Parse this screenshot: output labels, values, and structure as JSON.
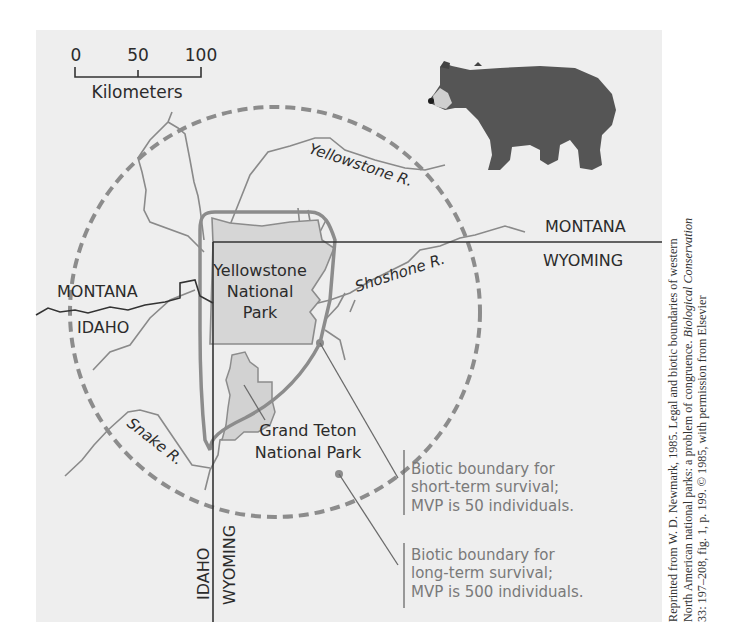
{
  "scale_bar": {
    "ticks": [
      "0",
      "50",
      "100"
    ],
    "unit_label": "Kilometers"
  },
  "state_labels": {
    "montana_east": "MONTANA",
    "wyoming_east": "WYOMING",
    "montana_west": "MONTANA",
    "idaho_west": "IDAHO",
    "idaho_south": "IDAHO",
    "wyoming_south": "WYOMING"
  },
  "rivers": {
    "yellowstone": "Yellowstone R.",
    "shoshone": "Shoshone R.",
    "snake": "Snake R."
  },
  "parks": {
    "yellowstone": [
      "Yellowstone",
      "National",
      "Park"
    ],
    "grand_teton": [
      "Grand Teton",
      "National Park"
    ]
  },
  "legend": {
    "short_term": [
      "Biotic boundary for",
      "short-term survival;",
      "MVP is 50 individuals."
    ],
    "long_term": [
      "Biotic boundary for",
      "long-term survival;",
      "MVP is 500 individuals."
    ]
  },
  "illustration": {
    "icon": "grizzly-bear-icon"
  },
  "citation": {
    "line1": "Reprinted from W. D. Newmark, 1985. Legal and biotic boundaries of western",
    "line2_pre": "North American national parks: a problem of congruence. ",
    "line2_journal": "Biological Conservation",
    "line3": "33: 197–208, fig. 1, p. 199. © 1985, with permission from Elsevier"
  },
  "colors": {
    "background": "#eeeeee",
    "state_line": "#333333",
    "biotic_boundary": "#8c8c8c",
    "river": "#8a8a8a",
    "park_fill": "#d6d6d6"
  }
}
